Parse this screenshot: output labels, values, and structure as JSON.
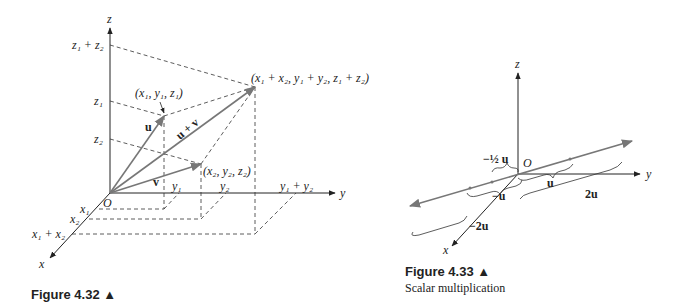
{
  "figure_432": {
    "caption": "Figure 4.32 ▲",
    "axes": {
      "x": "x",
      "y": "y",
      "z": "z"
    },
    "origin": "O",
    "vectors": {
      "u": "u",
      "v": "v",
      "sum": "u + v"
    },
    "points": {
      "p1": "(x₁, y₁, z₁)",
      "p2": "(x₂, y₂, z₂)",
      "sum": "(x₁ + x₂, y₁ + y₂, z₁ + z₂)"
    },
    "ticks": {
      "z": [
        "z₁ + z₂",
        "z₁",
        "z₂"
      ],
      "y": [
        "y₁",
        "y₂",
        "y₁ + y₂"
      ],
      "x": [
        "x₁",
        "x₂",
        "x₁ + x₂"
      ]
    }
  },
  "figure_433": {
    "caption": "Figure 4.33 ▲",
    "subtitle": "Scalar multiplication",
    "axes": {
      "x": "x",
      "y": "y",
      "z": "z"
    },
    "origin": "O",
    "labels": {
      "half_neg": "−½ u",
      "u": "u",
      "neg_u": "−u",
      "two_u": "2u",
      "neg_two_u": "−2u"
    }
  }
}
